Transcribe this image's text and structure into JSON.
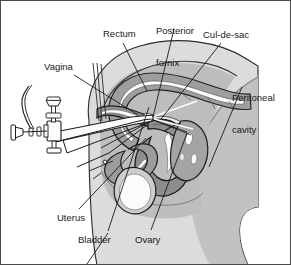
{
  "figure": {
    "type": "medical-illustration",
    "style": "grayscale line drawing with tonal shading",
    "border_color": "#4a4a4a",
    "background_color": "#ffffff"
  },
  "palette": {
    "ink": "#1a1a1a",
    "label_text": "#181818",
    "leader_line": "#111111",
    "body_light": "#dcdcdc",
    "body_mid": "#c0c0c0",
    "body_dark": "#a8a8a8",
    "organ_fill": "#9a9a9a",
    "organ_dark": "#8a8a8a",
    "organ_light": "#cfcfcf",
    "lumen_white": "#ffffff",
    "instrument_fill": "#fdfdfd"
  },
  "labels": [
    {
      "id": "posterior-fornix",
      "text_lines": [
        "Posterior",
        "fornix"
      ],
      "text": "Posterior fornix",
      "x": 155,
      "y": 5
    },
    {
      "id": "cul-de-sac",
      "text_lines": [
        "Cul-de-sac"
      ],
      "text": "Cul-de-sac",
      "x": 204,
      "y": 30
    },
    {
      "id": "rectum",
      "text_lines": [
        "Rectum"
      ],
      "text": "Rectum",
      "x": 103,
      "y": 29
    },
    {
      "id": "vagina",
      "text_lines": [
        "Vagina"
      ],
      "text": "Vagina",
      "x": 44,
      "y": 62
    },
    {
      "id": "peritoneal-cavity",
      "text_lines": [
        "Peritoneal",
        "cavity"
      ],
      "text": "Peritoneal cavity",
      "x": 232,
      "y": 72
    },
    {
      "id": "uterus",
      "text_lines": [
        "Uterus"
      ],
      "text": "Uterus",
      "x": 57,
      "y": 213
    },
    {
      "id": "bladder",
      "text_lines": [
        "Bladder"
      ],
      "text": "Bladder",
      "x": 78,
      "y": 235
    },
    {
      "id": "ovary",
      "text_lines": [
        "Ovary"
      ],
      "text": "Ovary",
      "x": 135,
      "y": 235
    }
  ],
  "leader_lines": [
    {
      "id": "leader-posterior-fornix",
      "from": [
        173,
        28
      ],
      "to": [
        152,
        116
      ]
    },
    {
      "id": "leader-cul-de-sac",
      "from": [
        220,
        42
      ],
      "to": [
        160,
        118
      ]
    },
    {
      "id": "leader-rectum",
      "from": [
        122,
        42
      ],
      "to": [
        146,
        90
      ]
    },
    {
      "id": "leader-vagina",
      "from": [
        73,
        74
      ],
      "to": [
        137,
        114
      ]
    },
    {
      "id": "leader-peritoneal-cavity",
      "from": [
        241,
        86
      ],
      "to": [
        208,
        166
      ]
    },
    {
      "id": "leader-uterus",
      "from": [
        78,
        208
      ],
      "to": [
        145,
        137
      ]
    },
    {
      "id": "leader-bladder",
      "from": [
        107,
        230
      ],
      "to": [
        85,
        262
      ]
    },
    {
      "id": "leader-bladder-upper",
      "from": [
        107,
        230
      ],
      "to": [
        148,
        106
      ]
    },
    {
      "id": "leader-ovary",
      "from": [
        150,
        229
      ],
      "to": [
        186,
        132
      ]
    }
  ],
  "anatomy_structures": [
    {
      "id": "body-torso-outline",
      "label": "Maternal torso / pelvis silhouette"
    },
    {
      "id": "pelvic-soft-tissue",
      "label": "Pelvic soft tissue (light gray)"
    },
    {
      "id": "buttock-thigh-mass",
      "label": "Buttock and thigh mass (mid gray)"
    },
    {
      "id": "rectum-structure",
      "label": "Rectum"
    },
    {
      "id": "rectum-lumen",
      "label": "Rectal lumen"
    },
    {
      "id": "vagina-structure",
      "label": "Vagina"
    },
    {
      "id": "posterior-fornix-structure",
      "label": "Posterior fornix"
    },
    {
      "id": "cul-de-sac-structure",
      "label": "Cul-de-sac (rectouterine pouch)"
    },
    {
      "id": "uterus-structure",
      "label": "Uterus"
    },
    {
      "id": "uterine-cavity",
      "label": "Uterine cavity"
    },
    {
      "id": "bladder-structure",
      "label": "Bladder"
    },
    {
      "id": "ovary-structure",
      "label": "Ovary with follicles"
    },
    {
      "id": "peritoneal-cavity-region",
      "label": "Peritoneal cavity"
    }
  ],
  "instrument": {
    "id": "transvaginal-probe-needle-guide",
    "label": "Transvaginal ultrasound probe with needle guide",
    "parts": [
      {
        "id": "probe-shaft",
        "label": "Probe shaft"
      },
      {
        "id": "needle-guide-shaft",
        "label": "Needle guide shaft"
      },
      {
        "id": "aspiration-needle",
        "label": "Aspiration needle"
      },
      {
        "id": "stopcock-valve",
        "label": "Stopcock valve"
      },
      {
        "id": "valve-handle-upper",
        "label": "Upper valve handle"
      },
      {
        "id": "valve-handle-lower",
        "label": "Lower valve handle"
      },
      {
        "id": "luer-connector",
        "label": "Luer connector"
      },
      {
        "id": "suction-tubing",
        "label": "Suction tubing"
      }
    ]
  }
}
